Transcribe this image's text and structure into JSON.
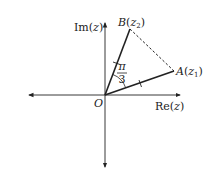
{
  "diagram": {
    "type": "argand-diagram",
    "axes": {
      "real_label": "Re(z)",
      "imag_label": "Im(z)",
      "origin_label": "O"
    },
    "points": {
      "A": {
        "name": "A",
        "value": "z",
        "subscript": "1",
        "label": "A(z1)"
      },
      "B": {
        "name": "B",
        "value": "z",
        "subscript": "2",
        "label": "B(z2)"
      }
    },
    "angle": {
      "numerator": "π",
      "denominator": "3",
      "label": "π/3"
    },
    "segments": [
      {
        "from": "O",
        "to": "A",
        "style": "solid",
        "tick_mark": true
      },
      {
        "from": "O",
        "to": "B",
        "style": "solid",
        "tick_mark": true
      },
      {
        "from": "A",
        "to": "B",
        "style": "dashed"
      }
    ],
    "colors": {
      "line": "#222222",
      "background": "#ffffff"
    }
  }
}
